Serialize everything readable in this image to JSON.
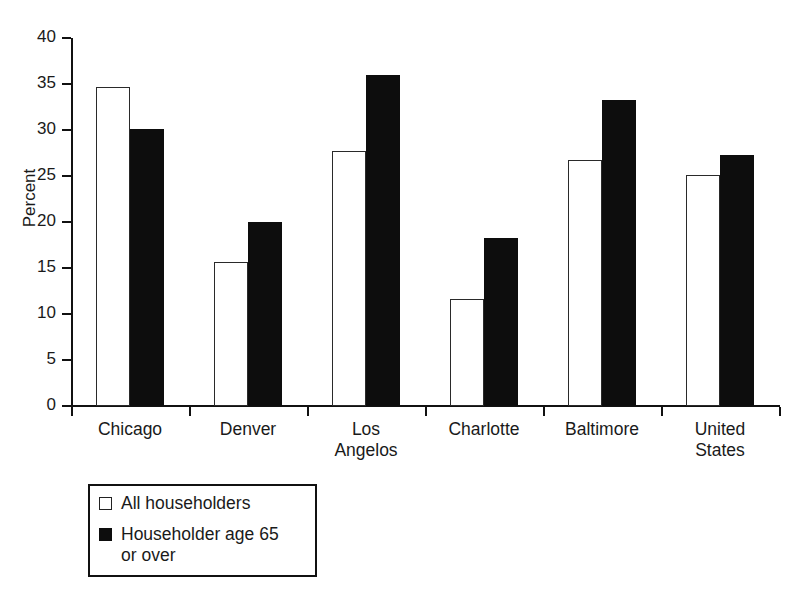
{
  "chart_data": {
    "type": "bar",
    "title": "",
    "subtitle": "",
    "xlabel": "",
    "ylabel": "Percent",
    "ylim": [
      0,
      40
    ],
    "ytick_step": 5,
    "yticks": [
      "40",
      "35",
      "30",
      "25",
      "20",
      "15",
      "10",
      "5",
      "0"
    ],
    "grid": false,
    "legend_position": "below-left",
    "categories": [
      "Chicago",
      "Denver",
      "Los\nAngelos",
      "Charlotte",
      "Baltimore",
      "United\nStates"
    ],
    "series": [
      {
        "name": "All householders",
        "color": "#ffffff",
        "edge_color": "#2a2a2a",
        "values": [
          34.7,
          15.7,
          27.7,
          11.6,
          26.7,
          25.1
        ]
      },
      {
        "name": "Householder age 65\nor over",
        "color": "#0d0d0d",
        "edge_color": "#0d0d0d",
        "values": [
          30.1,
          20.0,
          36.0,
          18.3,
          33.3,
          27.3
        ]
      }
    ]
  },
  "legend": {
    "items": [
      {
        "label": "All householders",
        "swatch": "white"
      },
      {
        "label": "Householder age 65\nor over",
        "swatch": "black"
      }
    ]
  }
}
